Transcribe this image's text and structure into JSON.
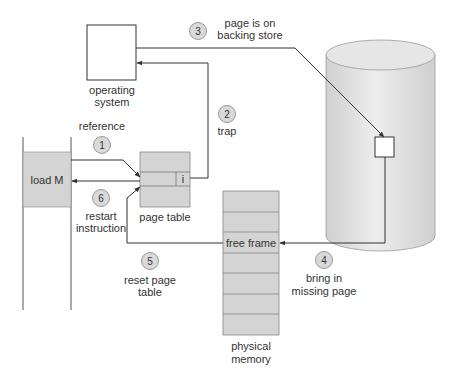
{
  "diagram": {
    "colors": {
      "line": "#333333",
      "box_fill": "#d4d4d4",
      "cylinder_fill": "#e2e2e2",
      "badge_fill": "#d9d9d9",
      "text": "#333333"
    },
    "operating_system": {
      "label_line1": "operating",
      "label_line2": "system"
    },
    "program": {
      "instruction": "load M"
    },
    "page_table": {
      "label": "page table",
      "bit": "i"
    },
    "physical_memory": {
      "label_line1": "physical",
      "label_line2": "memory",
      "free_frame": "free frame",
      "frame_count": 7
    },
    "backing_store": {
      "label": ""
    },
    "steps": [
      {
        "number": "1",
        "line1": "reference",
        "line2": ""
      },
      {
        "number": "2",
        "line1": "trap",
        "line2": ""
      },
      {
        "number": "3",
        "line1": "page is on",
        "line2": "backing store"
      },
      {
        "number": "4",
        "line1": "bring in",
        "line2": "missing page"
      },
      {
        "number": "5",
        "line1": "reset page",
        "line2": "table"
      },
      {
        "number": "6",
        "line1": "restart",
        "line2": "instruction"
      }
    ]
  }
}
